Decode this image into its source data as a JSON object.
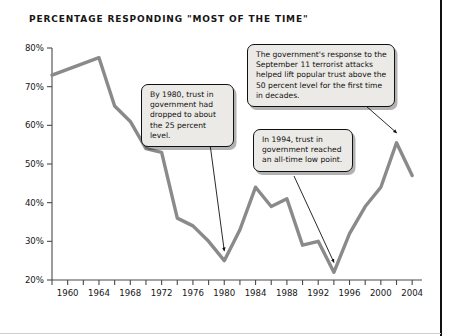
{
  "page": {
    "title": "PERCENTAGE RESPONDING \"MOST OF THE TIME\""
  },
  "colors": {
    "line": "#8a8a8a",
    "axis": "#4a4a4a",
    "callout_bg": "#eceae6",
    "callout_border": "#111111",
    "text": "#161616",
    "page_rule": "#111111"
  },
  "callouts": [
    {
      "id": "callout-1980",
      "text": "By 1980, trust in government had dropped to about the 25 percent level.",
      "points_to_year": 1980
    },
    {
      "id": "callout-sept11",
      "text": "The government's response to the September 11 terrorist attacks helped lift popular trust above the 50 percent level for the first time in decades.",
      "points_to_year": 2002
    },
    {
      "id": "callout-1994",
      "text": "In 1994, trust in government reached an all-time low point.",
      "points_to_year": 1994
    }
  ],
  "chart_data": {
    "type": "line",
    "title": "PERCENTAGE RESPONDING \"MOST OF THE TIME\"",
    "xlabel": "",
    "ylabel": "",
    "xlim": [
      1958,
      2005
    ],
    "ylim": [
      20,
      80
    ],
    "yticks": [
      20,
      30,
      40,
      50,
      60,
      70,
      80
    ],
    "ytick_labels": [
      "20%",
      "30%",
      "40%",
      "50%",
      "60%",
      "70%",
      "80%"
    ],
    "xticks": [
      1958,
      1960,
      1962,
      1964,
      1966,
      1968,
      1970,
      1972,
      1974,
      1976,
      1978,
      1980,
      1982,
      1984,
      1986,
      1988,
      1990,
      1992,
      1994,
      1996,
      1998,
      2000,
      2002,
      2004
    ],
    "xtick_labels": [
      "1960",
      "1964",
      "1968",
      "1972",
      "1976",
      "1980",
      "1984",
      "1988",
      "1992",
      "1996",
      "2000",
      "2004"
    ],
    "xtick_label_years": [
      1960,
      1964,
      1968,
      1972,
      1976,
      1980,
      1984,
      1988,
      1992,
      1996,
      2000,
      2004
    ],
    "grid": false,
    "legend": false,
    "series": [
      {
        "name": "Trust in government most of the time",
        "x": [
          1958,
          1964,
          1966,
          1968,
          1970,
          1972,
          1974,
          1976,
          1978,
          1980,
          1982,
          1984,
          1986,
          1988,
          1990,
          1992,
          1994,
          1996,
          1998,
          2000,
          2002,
          2004
        ],
        "values": [
          73,
          77.5,
          65,
          61,
          54,
          53,
          36,
          34,
          30,
          25,
          33,
          44,
          39,
          41,
          29,
          30,
          22,
          32,
          39,
          44,
          55.5,
          47
        ]
      }
    ],
    "annotations": [
      {
        "year": 1980,
        "value": 25,
        "note": "By 1980, trust in government had dropped to about the 25 percent level."
      },
      {
        "year": 1994,
        "value": 22,
        "note": "In 1994, trust in government reached an all-time low point."
      },
      {
        "year": 2002,
        "value": 55.5,
        "note": "The government's response to the September 11 terrorist attacks helped lift popular trust above the 50 percent level for the first time in decades."
      }
    ]
  }
}
